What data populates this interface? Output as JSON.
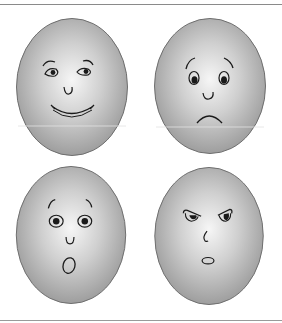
{
  "colors": {
    "face_center": "#f4f4f4",
    "face_edge": "#9a9a9a",
    "face_outline": "#6e6e6e",
    "stroke": "#1a1a1a",
    "rule": "#8a8a8a",
    "background": "#ffffff"
  },
  "faces": [
    {
      "position": "top-left",
      "expression": "happy",
      "label": "Happy face"
    },
    {
      "position": "top-right",
      "expression": "sad",
      "label": "Sad face"
    },
    {
      "position": "bottom-left",
      "expression": "surprised",
      "label": "Surprised face"
    },
    {
      "position": "bottom-right",
      "expression": "angry",
      "label": "Angry face"
    }
  ]
}
